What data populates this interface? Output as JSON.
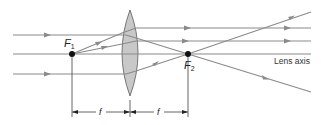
{
  "diagram": {
    "type": "converging lens ray diagram",
    "focal_points": [
      {
        "label": "F",
        "subscript": "1",
        "x": 72,
        "y": 54
      },
      {
        "label": "F",
        "subscript": "2",
        "x": 188,
        "y": 54
      }
    ],
    "axis_label": "Lens axis",
    "dimension_labels": [
      "f",
      "f"
    ],
    "colors": {
      "ray": "#8a8a8a",
      "lens_fill": "#c8c8c8",
      "lens_stroke": "#6a6a6a",
      "focal_dot": "#111111"
    }
  }
}
